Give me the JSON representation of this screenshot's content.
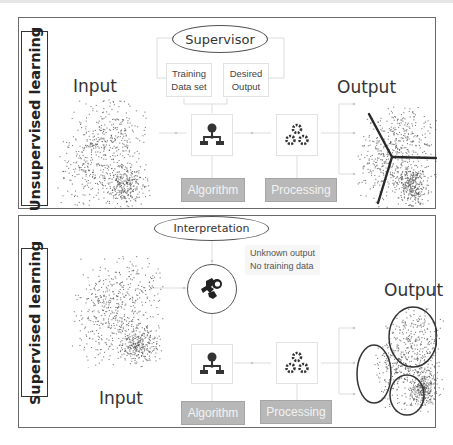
{
  "panels": {
    "unsupervised": {
      "side_label": "Unsupervised learning",
      "input_label": "Input",
      "output_label": "Output",
      "supervisor_label": "Supervisor",
      "cards": {
        "training": "Training Data set",
        "desired": "Desired Output"
      },
      "algorithm_label": "Algorithm",
      "processing_label": "Processing",
      "icons": [
        "hierarchy-icon",
        "gears-icon"
      ],
      "output_style": "partition-lines"
    },
    "supervised": {
      "side_label": "Supervised learning",
      "input_label": "Input",
      "output_label": "Output",
      "interpretation_label": "Interpretation",
      "note_lines": [
        "Unknown output",
        "No training data"
      ],
      "algorithm_label": "Algorithm",
      "processing_label": "Processing",
      "icons": [
        "puzzle-gear-icon",
        "hierarchy-icon",
        "gears-icon"
      ],
      "output_style": "cluster-ellipses"
    }
  },
  "scatter": {
    "point_color": "#555555",
    "clusters": [
      {
        "name": "upper",
        "cx": 0.62,
        "cy": 0.35,
        "sx": 0.17,
        "sy": 0.2,
        "n": 260
      },
      {
        "name": "left",
        "cx": 0.32,
        "cy": 0.55,
        "sx": 0.15,
        "sy": 0.2,
        "n": 260
      },
      {
        "name": "dense",
        "cx": 0.7,
        "cy": 0.78,
        "sx": 0.1,
        "sy": 0.09,
        "n": 300
      }
    ]
  },
  "colors": {
    "border": "#6a6a6a",
    "button_gray": "#b8b8b8",
    "connector": "#dddddd",
    "icon": "#333333"
  }
}
